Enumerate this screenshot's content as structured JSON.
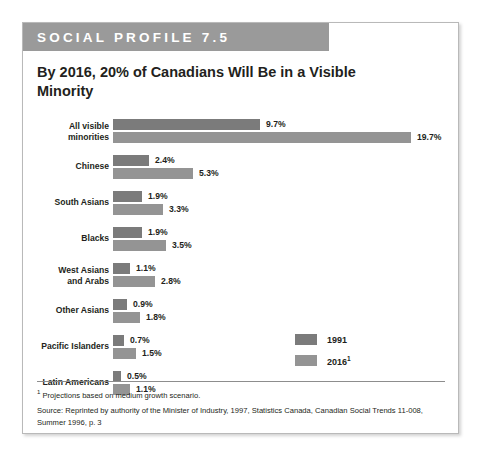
{
  "header": {
    "band_label": "SOCIAL PROFILE 7.5"
  },
  "title": "By 2016, 20% of Canadians Will Be in a Visible Minority",
  "legend": {
    "series": [
      {
        "label": "1991",
        "color": "#7b7b7b"
      },
      {
        "label": "2016",
        "superscript": "1",
        "color": "#949494"
      }
    ]
  },
  "footnote": {
    "marker": "1",
    "text": "Projections based on medium growth scenario.",
    "source": "Source: Reprinted by authority of the Minister of Industry, 1997, Statistics Canada, Canadian Social Trends 11-008, Summer 1996, p. 3"
  },
  "chart_data": {
    "type": "bar",
    "orientation": "horizontal",
    "title": "By 2016, 20% of Canadians Will Be in a Visible Minority",
    "xlabel": "",
    "ylabel": "",
    "grid": false,
    "legend_position": "inside-right",
    "xlim": [
      0,
      20
    ],
    "categories": [
      "All visible minorities",
      "Chinese",
      "South Asians",
      "Blacks",
      "West Asians and Arabs",
      "Other Asians",
      "Pacific Islanders",
      "Latin Americans"
    ],
    "series": [
      {
        "name": "1991",
        "color": "#7b7b7b",
        "values": [
          9.7,
          2.4,
          1.9,
          1.9,
          1.1,
          0.9,
          0.7,
          0.5
        ],
        "labels": [
          "9.7%",
          "2.4%",
          "1.9%",
          "1.9%",
          "1.1%",
          "0.9%",
          "0.7%",
          "0.5%"
        ]
      },
      {
        "name": "2016",
        "color": "#949494",
        "values": [
          19.7,
          5.3,
          3.3,
          3.5,
          2.8,
          1.8,
          1.5,
          1.1
        ],
        "labels": [
          "19.7%",
          "5.3%",
          "3.3%",
          "3.5%",
          "2.8%",
          "1.8%",
          "1.5%",
          "1.1%"
        ]
      }
    ]
  },
  "rows": [
    {
      "label_line1": "All visible",
      "label_line2": "minorities",
      "two_line": true,
      "v1991": "9.7%",
      "v2016": "19.7%",
      "w1991": 147,
      "w2016": 298,
      "top": 0,
      "label_top": 2
    },
    {
      "label_line1": "Chinese",
      "label_line2": "",
      "two_line": false,
      "v1991": "2.4%",
      "v2016": "5.3%",
      "w1991": 36,
      "w2016": 80,
      "top": 36,
      "label_top": 6
    },
    {
      "label_line1": "South Asians",
      "label_line2": "",
      "two_line": false,
      "v1991": "1.9%",
      "v2016": "3.3%",
      "w1991": 29,
      "w2016": 50,
      "top": 72,
      "label_top": 6
    },
    {
      "label_line1": "Blacks",
      "label_line2": "",
      "two_line": false,
      "v1991": "1.9%",
      "v2016": "3.5%",
      "w1991": 29,
      "w2016": 53,
      "top": 108,
      "label_top": 6
    },
    {
      "label_line1": "West Asians",
      "label_line2": "and Arabs",
      "two_line": true,
      "v1991": "1.1%",
      "v2016": "2.8%",
      "w1991": 17,
      "w2016": 42,
      "top": 144,
      "label_top": 2
    },
    {
      "label_line1": "Other Asians",
      "label_line2": "",
      "two_line": false,
      "v1991": "0.9%",
      "v2016": "1.8%",
      "w1991": 14,
      "w2016": 27,
      "top": 180,
      "label_top": 6
    },
    {
      "label_line1": "Pacific Islanders",
      "label_line2": "",
      "two_line": false,
      "v1991": "0.7%",
      "v2016": "1.5%",
      "w1991": 11,
      "w2016": 23,
      "top": 216,
      "label_top": 6
    },
    {
      "label_line1": "Latin Americans",
      "label_line2": "",
      "two_line": false,
      "v1991": "0.5%",
      "v2016": "1.1%",
      "w1991": 8,
      "w2016": 17,
      "top": 252,
      "label_top": 6
    }
  ]
}
